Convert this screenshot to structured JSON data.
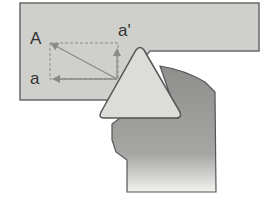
{
  "diagram": {
    "type": "cutting-tool-force-diagram",
    "labels": {
      "resultant": "A",
      "vertical_component": "a'",
      "horizontal_component": "a"
    },
    "colors": {
      "background": "#ffffff",
      "workpiece_fill": "#cfcfcc",
      "workpiece_stroke": "#6a6a6a",
      "insert_fill": "#dcdcd8",
      "insert_stroke": "#555555",
      "holder_fill": "#9a9a98",
      "holder_stroke": "#555555",
      "arrow": "#8a8a88",
      "dashed_box": "#8a8a88",
      "label": "#333333"
    },
    "parts": [
      {
        "name": "workpiece",
        "description": "light gray stock being cut"
      },
      {
        "name": "triangular-insert",
        "description": "triangular cutting insert"
      },
      {
        "name": "tool-holder",
        "description": "darker gray tool holder/shank"
      }
    ],
    "vectors": [
      {
        "name": "A",
        "from": "tool tip",
        "direction": "up-left (resultant)"
      },
      {
        "name": "a",
        "from": "tool tip",
        "direction": "left (horizontal component)"
      },
      {
        "name": "a'",
        "from": "tool tip",
        "direction": "up (vertical component)"
      }
    ]
  }
}
